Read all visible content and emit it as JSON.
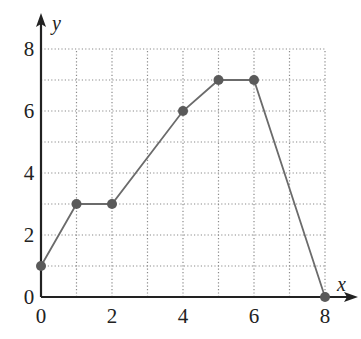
{
  "chart_data": {
    "type": "line",
    "title": "",
    "xlabel": "x",
    "ylabel": "y",
    "xlim": [
      0,
      8
    ],
    "ylim": [
      0,
      8
    ],
    "grid": true,
    "grid_style": "dotted",
    "grid_step": 1,
    "x_ticks": [
      0,
      2,
      4,
      6,
      8
    ],
    "y_ticks": [
      0,
      2,
      4,
      6,
      8
    ],
    "series": [
      {
        "name": "piecewise",
        "x": [
          0,
          1,
          2,
          4,
          5,
          6,
          8
        ],
        "y": [
          1,
          3,
          3,
          6,
          7,
          7,
          0
        ],
        "markers": true
      }
    ],
    "colors": {
      "line": "#6b6b6b",
      "marker": "#5a5a5a",
      "grid": "#8a8a8a",
      "axis": "#222222"
    }
  }
}
